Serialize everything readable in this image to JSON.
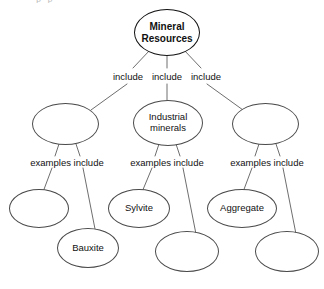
{
  "diagram": {
    "type": "concept-map",
    "title": "Mineral Resources",
    "background_color": "#ffffff",
    "node_stroke_color": "#4a4a4a",
    "root_stroke_color": "#111111",
    "edge_stroke_color": "#6e6e6e",
    "text_color": "#111111",
    "ghost_text": "p p"
  },
  "nodes": {
    "root": {
      "id": "mineral-resources",
      "label": "Mineral\nResources",
      "filled": true,
      "level": 0
    },
    "level1": [
      {
        "id": "category-left",
        "label": "",
        "filled": false,
        "level": 1
      },
      {
        "id": "industrial-minerals",
        "label": "Industrial\nminerals",
        "filled": true,
        "level": 1
      },
      {
        "id": "category-right",
        "label": "",
        "filled": false,
        "level": 1
      }
    ],
    "level2": [
      {
        "id": "example-1",
        "label": "",
        "filled": false,
        "level": 2,
        "parent": "category-left"
      },
      {
        "id": "example-2",
        "label": "Bauxite",
        "filled": true,
        "level": 2,
        "parent": "category-left"
      },
      {
        "id": "example-3",
        "label": "Sylvite",
        "filled": true,
        "level": 2,
        "parent": "industrial-minerals"
      },
      {
        "id": "example-4",
        "label": "",
        "filled": false,
        "level": 2,
        "parent": "industrial-minerals"
      },
      {
        "id": "example-5",
        "label": "Aggregate",
        "filled": true,
        "level": 2,
        "parent": "category-right"
      },
      {
        "id": "example-6",
        "label": "",
        "filled": false,
        "level": 2,
        "parent": "category-right"
      }
    ]
  },
  "edge_labels": {
    "include_left": "include",
    "include_middle": "include",
    "include_right": "include",
    "examples_left": "examples include",
    "examples_middle": "examples include",
    "examples_right": "examples include"
  }
}
